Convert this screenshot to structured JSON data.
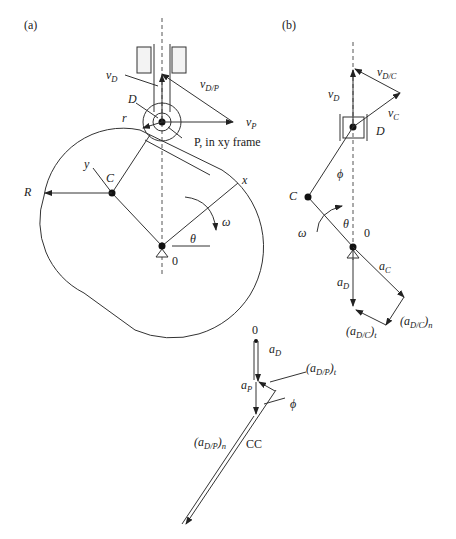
{
  "panels": {
    "a": {
      "label": "(a)",
      "labels": {
        "vD": "v",
        "vD_sub": "D",
        "vDP": "v",
        "vDP_sub": "D/P",
        "D": "D",
        "r": "r",
        "vP": "v",
        "vP_sub": "P",
        "P_frame": "P, in xy frame",
        "y": "y",
        "C": "C",
        "R": "R",
        "x": "x",
        "omega": "ω",
        "theta": "θ",
        "O": "0"
      }
    },
    "b": {
      "label": "(b)",
      "labels": {
        "vDC": "v",
        "vDC_sub": "D/C",
        "vD": "v",
        "vD_sub": "D",
        "vC": "v",
        "vC_sub": "C",
        "D": "D",
        "phi": "ϕ",
        "C": "C",
        "theta": "θ",
        "omega": "ω",
        "O": "0",
        "aC": "a",
        "aC_sub": "C",
        "aD": "a",
        "aD_sub": "D",
        "aDCn": "(a",
        "aDCn_sub": "D/C",
        "aDCn_tail": ")",
        "aDCn_sub2": "n",
        "aDCt": "(a",
        "aDCt_sub": "D/C",
        "aDCt_tail": ")",
        "aDCt_sub2": "t"
      }
    },
    "c": {
      "labels": {
        "O": "0",
        "aD": "a",
        "aD_sub": "D",
        "aDPt": "(a",
        "aDPt_sub": "D/P",
        "aDPt_tail": ")",
        "aDPt_sub2": "t",
        "aP": "a",
        "aP_sub": "P",
        "phi": "ϕ",
        "aDPn": "(a",
        "aDPn_sub": "D/P",
        "aDPn_tail": ")",
        "aDPn_sub2": "n",
        "CC": "CC"
      }
    }
  },
  "colors": {
    "line": "#333333",
    "text": "#222222",
    "background": "#ffffff"
  }
}
